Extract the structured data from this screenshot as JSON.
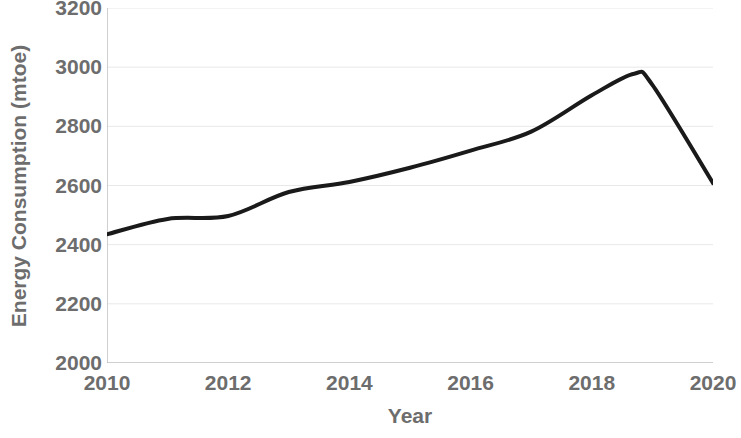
{
  "chart_data": {
    "type": "line",
    "title": "",
    "xlabel": "Year",
    "ylabel": "Energy Consumption (mtoe)",
    "xlim": [
      2010,
      2020
    ],
    "ylim": [
      2000,
      3200
    ],
    "xticks": [
      2010,
      2012,
      2014,
      2016,
      2018,
      2020
    ],
    "xtick_labels": [
      "2010",
      "2012",
      "2014",
      "2016",
      "2018",
      "2020"
    ],
    "yticks": [
      2000,
      2200,
      2400,
      2600,
      2800,
      3000,
      3200
    ],
    "ytick_labels": [
      "2000",
      "2200",
      "2400",
      "2600",
      "2800",
      "3000",
      "3200"
    ],
    "grid": "horizontal",
    "legend": "none",
    "line_color": "#1a1a1a",
    "line_width": 4,
    "axis_color": "#bfbfbf",
    "text_color": "#6d6d6d",
    "x": [
      2010,
      2011,
      2012,
      2013,
      2014,
      2015,
      2016,
      2017,
      2018,
      2018.7,
      2019,
      2020
    ],
    "values": [
      2435,
      2487,
      2497,
      2578,
      2612,
      2660,
      2718,
      2782,
      2905,
      2978,
      2940,
      2608
    ],
    "series": [
      {
        "name": "Energy Consumption",
        "values": [
          2435,
          2487,
          2497,
          2578,
          2612,
          2660,
          2718,
          2782,
          2905,
          2978,
          2940,
          2608
        ]
      }
    ]
  }
}
